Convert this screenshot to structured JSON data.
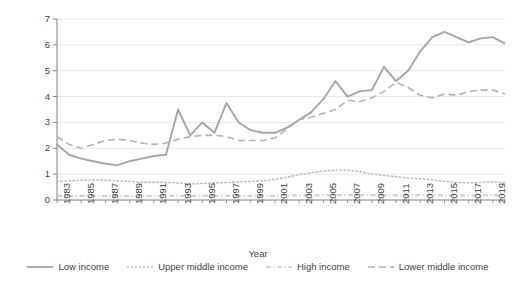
{
  "chart_data": {
    "type": "line",
    "title": "",
    "xlabel": "Year",
    "ylabel": "Remittances as share of GDP (%)",
    "ylim": [
      0,
      7
    ],
    "yticks": [
      0,
      1,
      2,
      3,
      4,
      5,
      6,
      7
    ],
    "xlim": [
      1983,
      2020
    ],
    "grid": "horizontal",
    "legend_position": "bottom",
    "x": [
      1983,
      1984,
      1985,
      1986,
      1987,
      1988,
      1989,
      1990,
      1991,
      1992,
      1993,
      1994,
      1995,
      1996,
      1997,
      1998,
      1999,
      2000,
      2001,
      2002,
      2003,
      2004,
      2005,
      2006,
      2007,
      2008,
      2009,
      2010,
      2011,
      2012,
      2013,
      2014,
      2015,
      2016,
      2017,
      2018,
      2019,
      2020
    ],
    "xticklabels": [
      "1983",
      "1985",
      "1987",
      "1989",
      "1991",
      "1993",
      "1995",
      "1997",
      "1999",
      "2001",
      "2003",
      "2005",
      "2007",
      "2009",
      "2011",
      "2013",
      "2015",
      "2017",
      "2019"
    ],
    "series": [
      {
        "name": "Low income",
        "style": "solid",
        "color": "#a6a6a6",
        "values": [
          2.15,
          1.75,
          1.6,
          1.5,
          1.4,
          1.35,
          1.5,
          1.6,
          1.7,
          1.75,
          3.5,
          2.5,
          3.0,
          2.6,
          3.75,
          3.0,
          2.7,
          2.6,
          2.6,
          2.8,
          3.1,
          3.4,
          3.9,
          4.6,
          4.0,
          4.2,
          4.25,
          5.15,
          4.6,
          5.0,
          5.75,
          6.3,
          6.5,
          6.3,
          6.1,
          6.25,
          6.3,
          6.05
        ]
      },
      {
        "name": "Upper middle income",
        "style": "dotted",
        "color": "#bfbfbf",
        "values": [
          0.72,
          0.74,
          0.76,
          0.78,
          0.76,
          0.74,
          0.72,
          0.68,
          0.68,
          0.68,
          0.66,
          0.62,
          0.64,
          0.66,
          0.68,
          0.7,
          0.72,
          0.74,
          0.8,
          0.88,
          0.98,
          1.05,
          1.12,
          1.15,
          1.15,
          1.1,
          1.0,
          0.95,
          0.9,
          0.85,
          0.82,
          0.78,
          0.72,
          0.68,
          0.66,
          0.68,
          0.7,
          0.66
        ]
      },
      {
        "name": "High income",
        "style": "dashdot",
        "color": "#c8c8c8",
        "values": [
          0.16,
          0.16,
          0.16,
          0.16,
          0.16,
          0.16,
          0.16,
          0.16,
          0.16,
          0.17,
          0.17,
          0.17,
          0.17,
          0.17,
          0.17,
          0.17,
          0.17,
          0.17,
          0.17,
          0.18,
          0.18,
          0.18,
          0.18,
          0.19,
          0.19,
          0.19,
          0.18,
          0.18,
          0.18,
          0.18,
          0.18,
          0.18,
          0.18,
          0.18,
          0.18,
          0.18,
          0.18,
          0.18
        ]
      },
      {
        "name": "Lower middle income",
        "style": "dashed",
        "color": "#b3b3b3",
        "values": [
          2.45,
          2.15,
          2.0,
          2.15,
          2.3,
          2.35,
          2.3,
          2.2,
          2.15,
          2.2,
          2.35,
          2.45,
          2.5,
          2.5,
          2.45,
          2.3,
          2.3,
          2.3,
          2.4,
          2.75,
          3.1,
          3.2,
          3.35,
          3.5,
          3.85,
          3.8,
          3.95,
          4.2,
          4.55,
          4.35,
          4.05,
          3.95,
          4.1,
          4.05,
          4.2,
          4.25,
          4.25,
          4.1
        ]
      }
    ]
  },
  "legend": {
    "items": [
      {
        "label": "Low income",
        "style": "solid"
      },
      {
        "label": "Upper middle income",
        "style": "dotted"
      },
      {
        "label": "High income",
        "style": "dashdot"
      },
      {
        "label": "Lower middle income",
        "style": "dashed"
      }
    ]
  },
  "colors": {
    "axis": "#808080",
    "grid": "#e8e8e8",
    "text": "#3f3f3f"
  }
}
